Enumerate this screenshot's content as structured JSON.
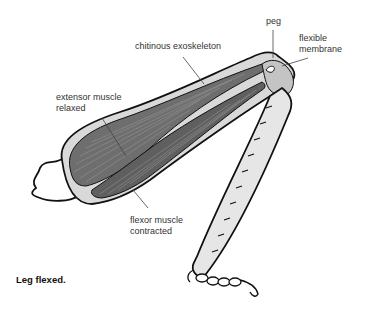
{
  "diagram": {
    "title": "Leg flexed.",
    "labels": {
      "peg": "peg",
      "flexible_membrane_line1": "flexible",
      "flexible_membrane_line2": "membrane",
      "chitinous_exoskeleton": "chitinous exoskeleton",
      "extensor_line1": "extensor muscle",
      "extensor_line2": "relaxed",
      "flexor_line1": "flexor muscle",
      "flexor_line2": "contracted"
    },
    "colors": {
      "outline": "#111111",
      "exoskeleton_fill": "#d9d9d9",
      "muscle_fill": "#6e6e6e",
      "muscle_fibre": "#9a9a9a",
      "joint_fill": "#c4c4c4",
      "tibia_fill": "#e6e6e6",
      "leader_line": "#444444"
    }
  }
}
